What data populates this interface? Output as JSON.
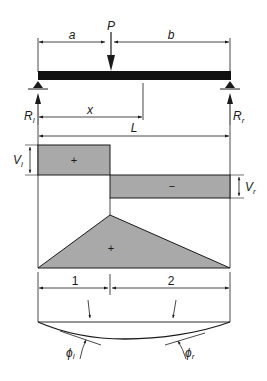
{
  "diagram": {
    "colors": {
      "stroke": "#1a1a1a",
      "fill_shaded": "#a9a9a9",
      "beam": "#111111",
      "background": "#ffffff"
    },
    "load": {
      "label": "P"
    },
    "dimensions": {
      "a": "a",
      "b": "b",
      "x": "x",
      "L": "L",
      "segment_1": "1",
      "segment_2": "2"
    },
    "reactions": {
      "left": {
        "main": "R",
        "sub": "l"
      },
      "right": {
        "main": "R",
        "sub": "r"
      }
    },
    "shear_diagram": {
      "left": {
        "main": "V",
        "sub": "l",
        "sign": "+"
      },
      "right": {
        "main": "V",
        "sub": "r",
        "sign": "−"
      }
    },
    "moment_diagram": {
      "sign": "+"
    },
    "deflection": {
      "left_slope": {
        "main": "ϕ",
        "sub": "l"
      },
      "right_slope": {
        "main": "ϕ",
        "sub": "r"
      }
    }
  }
}
